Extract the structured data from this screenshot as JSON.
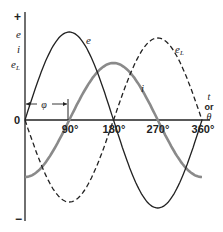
{
  "diagram": {
    "title": "",
    "y_axis": {
      "plus_label": "+",
      "minus_label": "−",
      "labels": [
        "e",
        "i",
        "e_L"
      ],
      "origin_label": "0"
    },
    "x_axis": {
      "tick_labels": [
        "90°",
        "180°",
        "270°",
        "360°"
      ],
      "axis_label_lines": [
        "t",
        "or",
        "θ"
      ]
    },
    "curves": [
      {
        "name": "e",
        "label": "e",
        "style": "solid",
        "color": "#222222",
        "phase_deg": 0,
        "amplitude": 88
      },
      {
        "name": "i",
        "label": "i",
        "style": "solid-gray",
        "color": "#8a8a8a",
        "phase_deg": -90,
        "amplitude": 57
      },
      {
        "name": "e_L",
        "label": "e",
        "label_sub": "L",
        "style": "dashed",
        "color": "#222222",
        "phase_deg": 180,
        "amplitude": 82
      }
    ],
    "phase_marker": {
      "label": "φ",
      "from_deg": 0,
      "to_deg": 90
    }
  }
}
